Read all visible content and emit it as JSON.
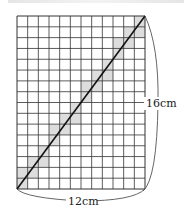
{
  "diagram": {
    "type": "grid-rectangle-with-diagonal",
    "grid": {
      "columns": 12,
      "rows": 16
    },
    "width_label": "12cm",
    "height_label": "16cm",
    "colors": {
      "grid_line": "#333333",
      "shade": "#dddddd",
      "diagonal": "#111111",
      "brace": "#555555"
    }
  }
}
